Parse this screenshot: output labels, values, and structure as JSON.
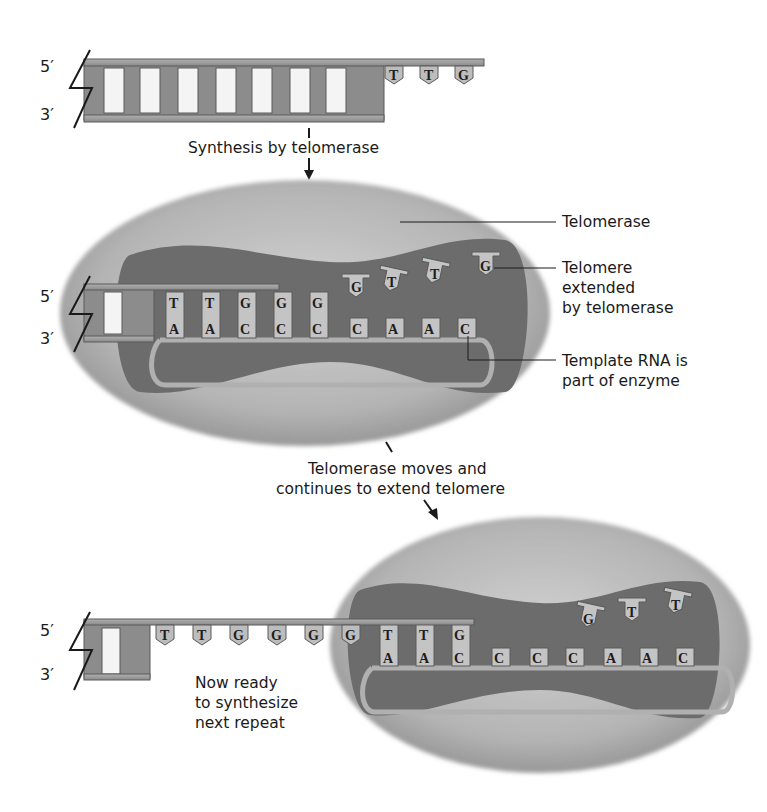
{
  "diagram": {
    "colors": {
      "dna_strand": "#9a9a9a",
      "dna_dark": "#6f6f6f",
      "base_tile": "#c4c4c4",
      "enzyme_outer": "#b8b8b8",
      "enzyme_inner": "#6e6e6e",
      "text": "#1a1a1a"
    },
    "stage1": {
      "prime_top": "5′",
      "prime_bottom": "3′",
      "overhang_bases": [
        "T",
        "T",
        "G"
      ],
      "arrow_label": "Synthesis by telomerase"
    },
    "stage2": {
      "prime_top": "5′",
      "prime_bottom": "3′",
      "top_paired_bases": [
        "T",
        "T",
        "G",
        "G",
        "G"
      ],
      "incoming_bases": [
        "G",
        "T",
        "T",
        "G"
      ],
      "template_rna_bases": [
        "A",
        "A",
        "C",
        "C",
        "C",
        "C",
        "A",
        "A",
        "C"
      ],
      "callouts": {
        "enzyme": "Telomerase",
        "telomere_line1": "Telomere",
        "telomere_line2": "extended",
        "telomere_line3": "by telomerase",
        "template_line1": "Template RNA is",
        "template_line2": "part of enzyme"
      },
      "arrow_label_line1": "Telomerase moves and",
      "arrow_label_line2": "continues to extend telomere"
    },
    "stage3": {
      "prime_top": "5′",
      "prime_bottom": "3′",
      "extended_bases": [
        "T",
        "T",
        "G",
        "G",
        "G",
        "G"
      ],
      "top_paired_bases": [
        "T",
        "T",
        "G"
      ],
      "incoming_bases": [
        "G",
        "T",
        "T"
      ],
      "template_rna_bases": [
        "A",
        "A",
        "C",
        "C",
        "C",
        "C",
        "A",
        "A",
        "C"
      ],
      "note_line1": "Now ready",
      "note_line2": "to synthesize",
      "note_line3": "next repeat"
    }
  }
}
